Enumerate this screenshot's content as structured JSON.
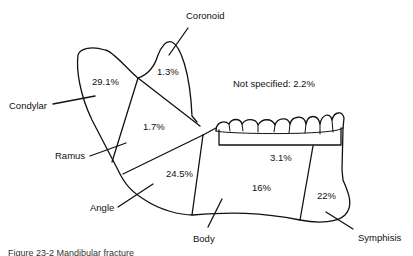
{
  "diagram": {
    "regions": [
      {
        "name": "Condylar",
        "percent": "29.1%"
      },
      {
        "name": "Coronoid",
        "percent": "1.3%"
      },
      {
        "name": "Ramus",
        "percent": "1.7%"
      },
      {
        "name": "Angle",
        "percent": "24.5%"
      },
      {
        "name": "Alveolar",
        "percent": "3.1%"
      },
      {
        "name": "Body",
        "percent": "16%"
      },
      {
        "name": "Symphisis",
        "percent": "22%"
      }
    ],
    "labels": {
      "coronoid": "Coronoid",
      "condylar": "Condylar",
      "ramus": "Ramus",
      "angle": "Angle",
      "body": "Body",
      "symphisis": "Symphisis"
    },
    "percents": {
      "condylar": "29.1%",
      "coronoid": "1.3%",
      "ramus": "1.7%",
      "angle": "24.5%",
      "alveolar": "3.1%",
      "body": "16%",
      "symphisis": "22%"
    },
    "not_specified": "Not specified: 2.2%",
    "caption": "Figure 23-2 Mandibular fracture"
  }
}
